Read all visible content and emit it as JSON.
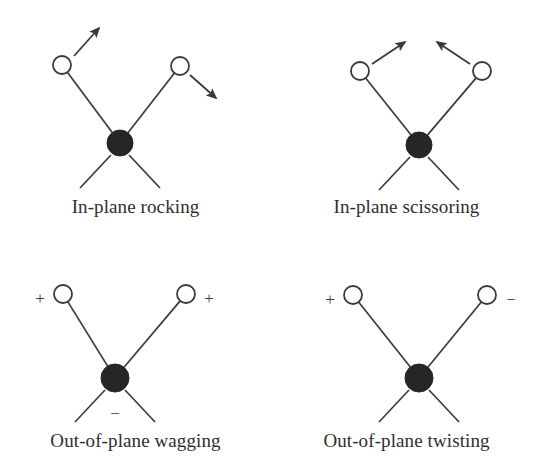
{
  "figure": {
    "title_visible": false,
    "background_color": "#ffffff",
    "stroke_color": "#3a3a3a",
    "atom_fill_color": "#262626",
    "hydrogen_fill_color": "#ffffff"
  },
  "panels": [
    {
      "id": "in-plane-rocking",
      "caption": "In-plane rocking",
      "caption_y": 196,
      "carbon": {
        "cx": 120,
        "cy": 143,
        "r": 13
      },
      "hydrogens": [
        {
          "cx": 62,
          "cy": 65,
          "r": 9,
          "sign": ""
        },
        {
          "cx": 180,
          "cy": 66,
          "r": 9,
          "sign": ""
        }
      ],
      "back_legs": [
        {
          "x1": 111,
          "y1": 155,
          "x2": 80,
          "y2": 188
        },
        {
          "x1": 129,
          "y1": 155,
          "x2": 160,
          "y2": 188
        }
      ],
      "arrows": [
        {
          "x1": 74,
          "y1": 56,
          "x2": 99,
          "y2": 28
        },
        {
          "x1": 190,
          "y1": 75,
          "x2": 216,
          "y2": 98
        }
      ],
      "signs": []
    },
    {
      "id": "in-plane-scissoring",
      "caption": "In-plane scissoring",
      "caption_y": 196,
      "carbon": {
        "cx": 148,
        "cy": 145,
        "r": 13
      },
      "hydrogens": [
        {
          "cx": 89,
          "cy": 71,
          "r": 9,
          "sign": ""
        },
        {
          "cx": 211,
          "cy": 71,
          "r": 9,
          "sign": ""
        }
      ],
      "back_legs": [
        {
          "x1": 139,
          "y1": 157,
          "x2": 108,
          "y2": 190
        },
        {
          "x1": 157,
          "y1": 157,
          "x2": 188,
          "y2": 190
        }
      ],
      "arrows": [
        {
          "x1": 101,
          "y1": 64,
          "x2": 134,
          "y2": 42
        },
        {
          "x1": 199,
          "y1": 64,
          "x2": 166,
          "y2": 42
        }
      ],
      "signs": []
    },
    {
      "id": "out-of-plane-wagging",
      "caption": "Out-of-plane wagging",
      "caption_y": 196,
      "carbon": {
        "cx": 115,
        "cy": 144,
        "r": 14
      },
      "hydrogens": [
        {
          "cx": 63,
          "cy": 60,
          "r": 9,
          "sign": "+"
        },
        {
          "cx": 186,
          "cy": 60,
          "r": 9,
          "sign": "+"
        }
      ],
      "back_legs": [
        {
          "x1": 105,
          "y1": 156,
          "x2": 75,
          "y2": 188
        },
        {
          "x1": 125,
          "y1": 156,
          "x2": 155,
          "y2": 188
        }
      ],
      "arrows": [],
      "signs": [
        {
          "text": "+",
          "x": 40,
          "y": 66
        },
        {
          "text": "+",
          "x": 209,
          "y": 66
        },
        {
          "text": "−",
          "x": 115,
          "y": 181
        }
      ]
    },
    {
      "id": "out-of-plane-twisting",
      "caption": "Out-of-plane twisting",
      "caption_y": 196,
      "carbon": {
        "cx": 148,
        "cy": 144,
        "r": 14
      },
      "hydrogens": [
        {
          "cx": 82,
          "cy": 61,
          "r": 9,
          "sign": "+"
        },
        {
          "cx": 216,
          "cy": 61,
          "r": 9,
          "sign": "−"
        }
      ],
      "back_legs": [
        {
          "x1": 138,
          "y1": 156,
          "x2": 108,
          "y2": 188
        },
        {
          "x1": 158,
          "y1": 156,
          "x2": 188,
          "y2": 188
        }
      ],
      "arrows": [],
      "signs": [
        {
          "text": "+",
          "x": 59,
          "y": 67
        },
        {
          "text": "−",
          "x": 240,
          "y": 67
        }
      ]
    }
  ],
  "panel_positions": [
    {
      "left": 0,
      "top": 0
    },
    {
      "left": 271,
      "top": 0
    },
    {
      "left": 0,
      "top": 234
    },
    {
      "left": 271,
      "top": 234
    }
  ]
}
